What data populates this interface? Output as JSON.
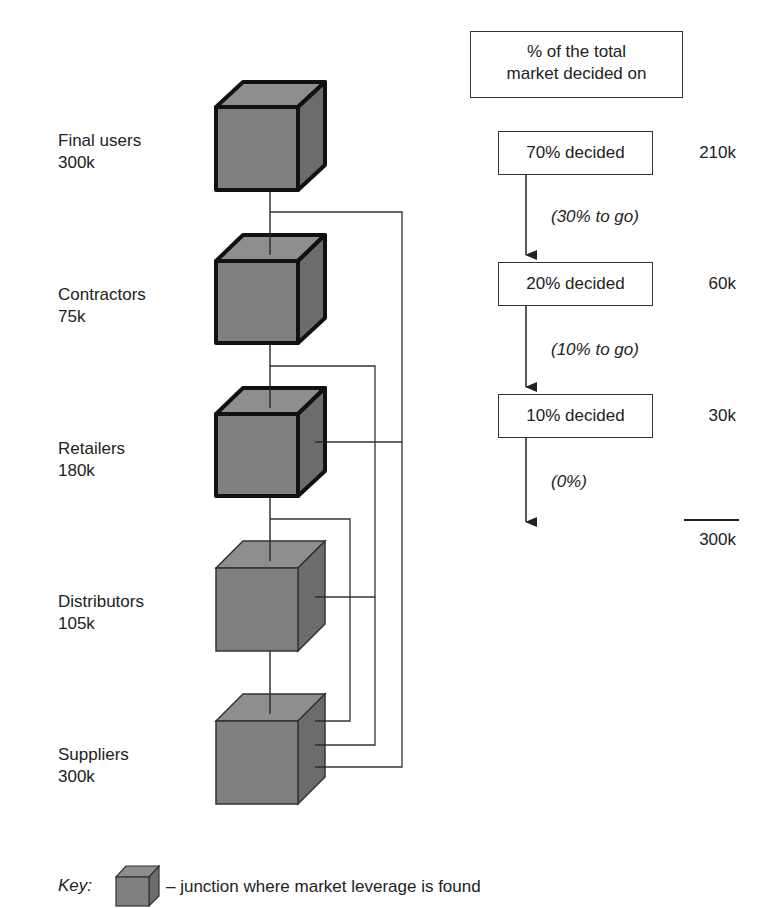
{
  "header_box": {
    "line1": "% of the total",
    "line2": "market decided on"
  },
  "nodes": [
    {
      "name": "Final users",
      "value": "300k",
      "leverage": true
    },
    {
      "name": "Contractors",
      "value": "75k",
      "leverage": true
    },
    {
      "name": "Retailers",
      "value": "180k",
      "leverage": true
    },
    {
      "name": "Distributors",
      "value": "105k",
      "leverage": false
    },
    {
      "name": "Suppliers",
      "value": "300k",
      "leverage": false
    }
  ],
  "decision_flow": [
    {
      "label": "70% decided",
      "value": "210k",
      "remaining": "(30% to go)"
    },
    {
      "label": "20% decided",
      "value": "60k",
      "remaining": "(10% to go)"
    },
    {
      "label": "10% decided",
      "value": "30k",
      "remaining": "(0%)"
    }
  ],
  "total": "300k",
  "key": {
    "label": "Key:",
    "description": "– junction where market leverage is found"
  },
  "colors": {
    "cube_front": "#7f7f7f",
    "cube_top": "#8e8e8e",
    "cube_side": "#6c6c6c",
    "line": "#333333"
  }
}
